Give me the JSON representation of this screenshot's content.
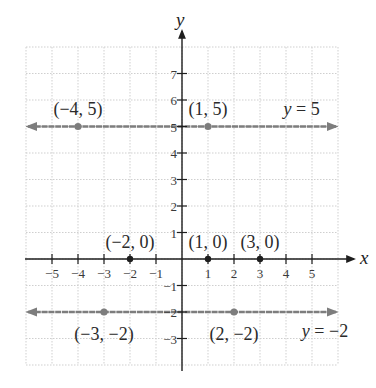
{
  "chart_data": {
    "type": "line",
    "title": "",
    "xlabel": "x",
    "ylabel": "y",
    "xlim": [
      -6,
      6
    ],
    "ylim": [
      -4,
      8
    ],
    "grid": true,
    "x_ticks": [
      -5,
      -4,
      -3,
      -2,
      -1,
      1,
      2,
      3,
      4,
      5
    ],
    "x_tick_labels": [
      "−5",
      "−4",
      "−3",
      "−2",
      "−1",
      "1",
      "2",
      "3",
      "4",
      "5"
    ],
    "y_ticks": [
      7,
      6,
      5,
      4,
      3,
      2,
      1,
      -1,
      -2,
      -3
    ],
    "y_tick_labels": [
      "7",
      "6",
      "5",
      "4",
      "3",
      "2",
      "1",
      "−1",
      "−2",
      "−3"
    ],
    "series": [
      {
        "name": "y = 5",
        "kind": "horizontal-line",
        "y": 5,
        "color": "#7d7d7d",
        "label": {
          "text_var": "y",
          "text_rest": " = 5",
          "x": 4.6,
          "y": 5.45
        },
        "points": [
          {
            "x": -4,
            "y": 5,
            "label": "(−4, 5)",
            "lx": -4,
            "ly": 5.45,
            "anchor": "middle"
          },
          {
            "x": 1,
            "y": 5,
            "label": "(1, 5)",
            "lx": 1,
            "ly": 5.45,
            "anchor": "middle"
          }
        ]
      },
      {
        "name": "y = −2",
        "kind": "horizontal-line",
        "y": -2,
        "color": "#7d7d7d",
        "label": {
          "text_var": "y",
          "text_rest": " = −2",
          "x": 5.5,
          "y": -2.95
        },
        "points": [
          {
            "x": -3,
            "y": -2,
            "label": "(−3, −2)",
            "lx": -3,
            "ly": -3.05,
            "anchor": "middle"
          },
          {
            "x": 2,
            "y": -2,
            "label": "(2, −2)",
            "lx": 2,
            "ly": -3.05,
            "anchor": "middle"
          }
        ]
      },
      {
        "name": "x-intercepts",
        "kind": "points",
        "color": "#1e1e1e",
        "points": [
          {
            "x": -2,
            "y": 0,
            "label": "(−2, 0)",
            "lx": -2,
            "ly": 0.4,
            "anchor": "middle"
          },
          {
            "x": 1,
            "y": 0,
            "label": "(1, 0)",
            "lx": 1,
            "ly": 0.4,
            "anchor": "middle"
          },
          {
            "x": 3,
            "y": 0,
            "label": "(3, 0)",
            "lx": 3,
            "ly": 0.4,
            "anchor": "middle"
          }
        ]
      }
    ],
    "layout": {
      "origin_px": [
        182,
        259
      ],
      "unit_x_px": 26,
      "unit_y_px": 26.5,
      "grid_color": "#cfcfcf",
      "axis_color": "#1e1e1e"
    }
  }
}
